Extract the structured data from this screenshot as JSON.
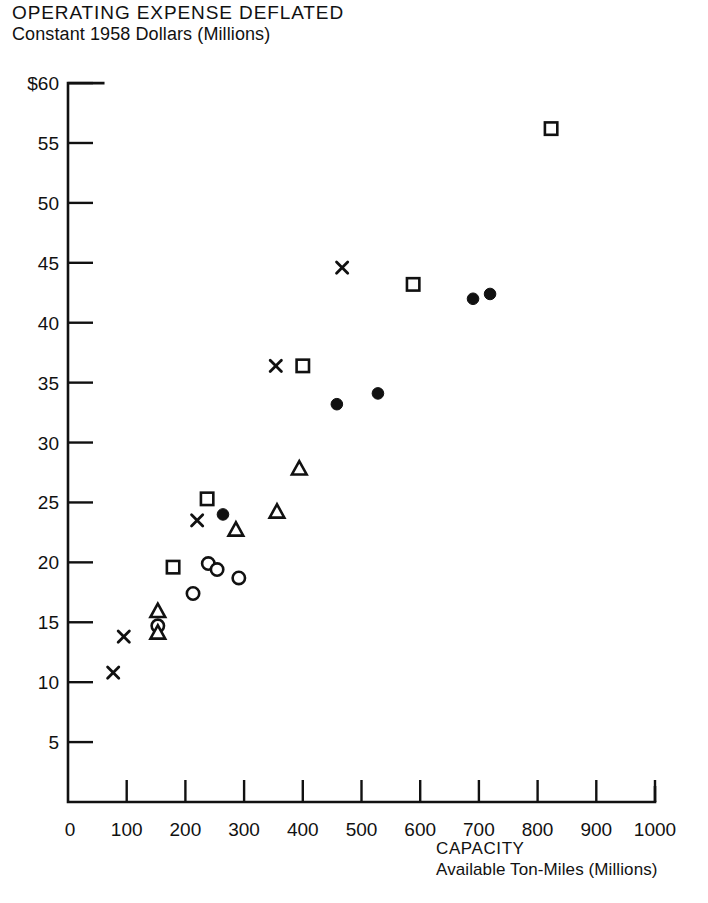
{
  "chart_data": {
    "type": "scatter",
    "title": "OPERATING EXPENSE DEFLATED",
    "subtitle": "Constant 1958 Dollars (Millions)",
    "xlabel": "CAPACITY",
    "xlabel_sub": "Available Ton-Miles (Millions)",
    "ylabel": "",
    "xlim": [
      0,
      1000
    ],
    "ylim": [
      0,
      60
    ],
    "xticks": [
      0,
      100,
      200,
      300,
      400,
      500,
      600,
      700,
      800,
      900,
      1000
    ],
    "xtick_labels": [
      "0",
      "100",
      "200",
      "300",
      "400",
      "500",
      "600",
      "700",
      "800",
      "900",
      "1000"
    ],
    "yticks": [
      5,
      10,
      15,
      20,
      25,
      30,
      35,
      40,
      45,
      50,
      55,
      60
    ],
    "ytick_labels": [
      "5",
      "10",
      "15",
      "20",
      "25",
      "30",
      "35",
      "40",
      "45",
      "50",
      "55",
      "$60"
    ],
    "y_origin_label": "0",
    "grid": false,
    "legend": false,
    "axis_color": "#111111",
    "marker_color": "#111111",
    "series": [
      {
        "name": "square",
        "marker": "open-square",
        "points": [
          {
            "x": 179,
            "y": 19.6
          },
          {
            "x": 237,
            "y": 25.3
          },
          {
            "x": 400,
            "y": 36.4
          },
          {
            "x": 588,
            "y": 43.2
          },
          {
            "x": 823,
            "y": 56.2
          }
        ]
      },
      {
        "name": "filled-circle",
        "marker": "filled-circle",
        "points": [
          {
            "x": 264,
            "y": 24.0
          },
          {
            "x": 458,
            "y": 33.2
          },
          {
            "x": 528,
            "y": 34.1
          },
          {
            "x": 690,
            "y": 42.0
          },
          {
            "x": 719,
            "y": 42.4
          }
        ]
      },
      {
        "name": "open-circle",
        "marker": "open-circle",
        "points": [
          {
            "x": 213,
            "y": 17.4
          },
          {
            "x": 239,
            "y": 19.9
          },
          {
            "x": 254,
            "y": 19.4
          },
          {
            "x": 291,
            "y": 18.7
          },
          {
            "x": 153,
            "y": 14.7
          }
        ]
      },
      {
        "name": "triangle",
        "marker": "open-triangle",
        "points": [
          {
            "x": 153,
            "y": 15.9
          },
          {
            "x": 153,
            "y": 14.1
          },
          {
            "x": 286,
            "y": 22.7
          },
          {
            "x": 356,
            "y": 24.2
          },
          {
            "x": 394,
            "y": 27.8
          }
        ]
      },
      {
        "name": "x-mark",
        "marker": "x",
        "points": [
          {
            "x": 77,
            "y": 10.8
          },
          {
            "x": 95,
            "y": 13.8
          },
          {
            "x": 220,
            "y": 23.5
          },
          {
            "x": 354,
            "y": 36.4
          },
          {
            "x": 467,
            "y": 44.6
          }
        ]
      }
    ]
  }
}
